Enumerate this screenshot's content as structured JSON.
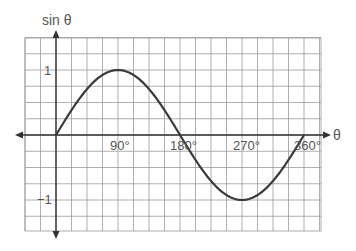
{
  "chart_data": {
    "type": "line",
    "title": "",
    "xlabel": "θ",
    "ylabel": "sin θ",
    "xlim": [
      -45,
      382.5
    ],
    "ylim": [
      -1.5,
      1.5
    ],
    "grid": true,
    "legend": null,
    "x_ticks": [
      {
        "value": 90,
        "label": "90°"
      },
      {
        "value": 180,
        "label": "180°"
      },
      {
        "value": 270,
        "label": "270°"
      },
      {
        "value": 360,
        "label": "360°"
      }
    ],
    "y_ticks": [
      {
        "value": 1,
        "label": "1"
      },
      {
        "value": -1,
        "label": "−1"
      }
    ],
    "series": [
      {
        "name": "sin θ",
        "x": [
          0,
          22.5,
          45,
          67.5,
          90,
          112.5,
          135,
          157.5,
          180,
          202.5,
          225,
          247.5,
          270,
          292.5,
          315,
          337.5,
          360
        ],
        "values": [
          0,
          0.38,
          0.71,
          0.92,
          1,
          0.92,
          0.71,
          0.38,
          0,
          -0.38,
          -0.71,
          -0.92,
          -1,
          -0.92,
          -0.71,
          -0.38,
          0
        ]
      }
    ]
  },
  "labels": {
    "y_axis": "sin θ",
    "x_axis": "θ",
    "x90": "90°",
    "x180": "180°",
    "x270": "270°",
    "x360": "360°",
    "y1": "1",
    "yneg1": "−1"
  },
  "colors": {
    "grid": "#9a9a9a",
    "axis": "#333333",
    "curve": "#3a3a3a",
    "text": "#555555"
  }
}
